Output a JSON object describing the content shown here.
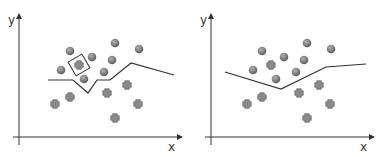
{
  "panels": [
    {
      "name": "overfit-boundary",
      "axis_labels": {
        "x": "x",
        "y": "y"
      },
      "circles": [
        [
          70,
          51
        ],
        [
          115,
          43
        ],
        [
          139,
          49
        ],
        [
          92,
          57
        ],
        [
          112,
          60
        ],
        [
          61,
          70
        ],
        [
          104,
          72
        ],
        [
          84,
          79
        ]
      ],
      "crosses": [
        [
          79,
          65
        ],
        [
          70,
          97
        ],
        [
          55,
          104
        ],
        [
          107,
          93
        ],
        [
          127,
          85
        ],
        [
          138,
          104
        ],
        [
          115,
          118
        ]
      ],
      "highlight": {
        "shape": "diamond",
        "center": [
          79,
          65
        ]
      },
      "boundary": [
        [
          48,
          80
        ],
        [
          73,
          80
        ],
        [
          88,
          93
        ],
        [
          97,
          80
        ],
        [
          110,
          80
        ],
        [
          131,
          63
        ],
        [
          174,
          75
        ]
      ]
    },
    {
      "name": "smooth-boundary",
      "axis_labels": {
        "x": "x",
        "y": "y"
      },
      "circles": [
        [
          262,
          51
        ],
        [
          307,
          43
        ],
        [
          331,
          49
        ],
        [
          284,
          57
        ],
        [
          304,
          60
        ],
        [
          253,
          70
        ],
        [
          296,
          72
        ],
        [
          276,
          79
        ]
      ],
      "crosses": [
        [
          271,
          65
        ],
        [
          262,
          97
        ],
        [
          247,
          104
        ],
        [
          299,
          93
        ],
        [
          319,
          85
        ],
        [
          330,
          104
        ],
        [
          307,
          118
        ]
      ],
      "boundary": [
        [
          225,
          72
        ],
        [
          281,
          89
        ],
        [
          326,
          67
        ],
        [
          366,
          64
        ]
      ]
    }
  ],
  "colors": {
    "axis": "#333333",
    "circle": "#808080",
    "cross": "#8a8a8a",
    "boundary": "#333333"
  }
}
